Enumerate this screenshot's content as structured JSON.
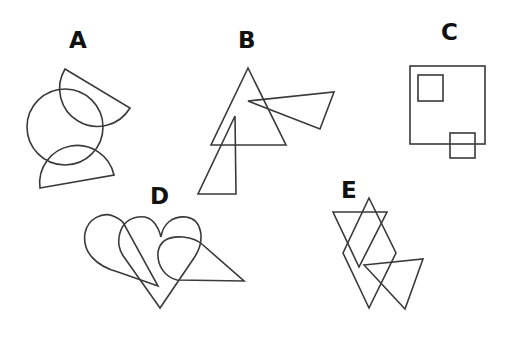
{
  "figures": [
    {
      "label": "A",
      "description": "circle overlapped by two semicircles (half-discs)"
    },
    {
      "label": "B",
      "description": "large triangle overlapped by two smaller triangles"
    },
    {
      "label": "C",
      "description": "large square containing a small square, with another small square overlapping its bottom edge"
    },
    {
      "label": "D",
      "description": "three overlapping heart shapes, two of them with a triangular extension"
    },
    {
      "label": "E",
      "description": "overlapping triangles and a rhombus"
    }
  ],
  "colors": {
    "stroke": "#3a3a3a",
    "label": "#111111",
    "background": "#ffffff"
  }
}
